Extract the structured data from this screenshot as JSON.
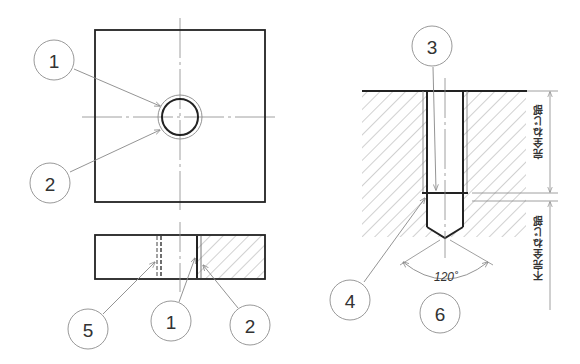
{
  "figure": {
    "left_view": {
      "top_view_callouts": [
        {
          "label": "1"
        },
        {
          "label": "2"
        }
      ],
      "side_view_callouts": [
        {
          "label": "5"
        },
        {
          "label": "1"
        },
        {
          "label": "2"
        }
      ]
    },
    "right_view": {
      "callouts": [
        {
          "label": "3"
        },
        {
          "label": "4"
        },
        {
          "label": "6"
        }
      ],
      "drill_angle": "120˚",
      "dim_complete_thread": "完全ねじ部",
      "dim_incomplete_thread": "不完全ねじ部"
    },
    "colors": {
      "line": "#222222",
      "thin_line": "#888888",
      "hatch": "#999999",
      "bubble_stroke": "#999999",
      "background": "#ffffff"
    }
  }
}
